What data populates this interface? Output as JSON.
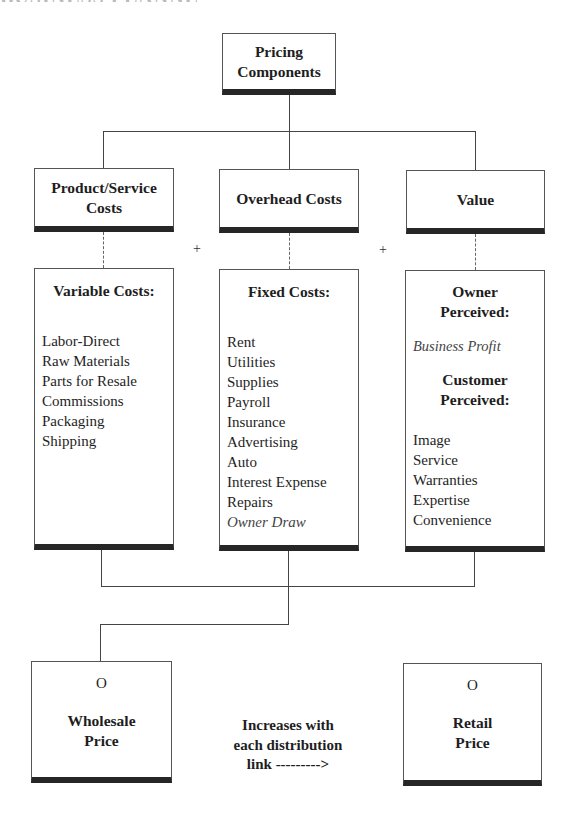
{
  "header": {
    "cutoff_text": "BUSINESS PLANNER"
  },
  "root": {
    "title_line1": "Pricing",
    "title_line2": "Components"
  },
  "categories": [
    {
      "title_line1": "Product/Service",
      "title_line2": "Costs"
    },
    {
      "title_line1": "Overhead Costs",
      "title_line2": ""
    },
    {
      "title_line1": "Value",
      "title_line2": ""
    }
  ],
  "operators": [
    "+",
    "+"
  ],
  "details": {
    "variable": {
      "heading": "Variable Costs:",
      "items": [
        "Labor-Direct",
        "Raw Materials",
        "Parts for Resale",
        "Commissions",
        "Packaging",
        "Shipping"
      ]
    },
    "fixed": {
      "heading": "Fixed Costs:",
      "items": [
        "Rent",
        "Utilities",
        "Supplies",
        "Payroll",
        "Insurance",
        "Advertising",
        "Auto",
        "Interest Expense",
        "Repairs"
      ],
      "italic_item": "Owner Draw"
    },
    "value": {
      "owner_heading_line1": "Owner",
      "owner_heading_line2": "Perceived:",
      "owner_item": "Business Profit",
      "customer_heading_line1": "Customer",
      "customer_heading_line2": "Perceived:",
      "customer_items": [
        "Image",
        "Service",
        "Warranties",
        "Expertise",
        "Convenience"
      ]
    }
  },
  "outputs": {
    "wholesale": {
      "mark": "O",
      "title_line1": "Wholesale",
      "title_line2": "Price"
    },
    "retail": {
      "mark": "O",
      "title_line1": "Retail",
      "title_line2": "Price"
    }
  },
  "note": {
    "line1": "Increases with",
    "line2": "each distribution",
    "line3": "link --------->"
  },
  "colors": {
    "box_border": "#555555",
    "box_bar": "#262626",
    "connector": "#444444",
    "text": "#1e1e1e"
  }
}
